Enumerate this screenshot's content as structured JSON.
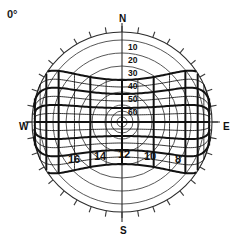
{
  "figure": {
    "kind": "horizon-coordinate-diagram",
    "latitude_label": "0°",
    "center": {
      "x": 122,
      "y": 122
    },
    "outer_radius": 90,
    "line_color": "#1a1a1a",
    "grid_color": "#3a3a3a",
    "background": "#ffffff"
  },
  "cardinals": {
    "north": "N",
    "south": "S",
    "west": "W",
    "east": "E"
  },
  "chart_data": {
    "type": "scatter",
    "title": "",
    "subtitle": "",
    "xlabel": "",
    "ylabel": "",
    "projection": "polar-altitude-azimuth",
    "grid": true,
    "legend_position": "none",
    "altitude_circles": {
      "label_axis": "north-meridian",
      "labels": [
        "10",
        "20",
        "30",
        "40",
        "50",
        "60"
      ],
      "values": [
        10,
        20,
        30,
        40,
        50,
        60
      ],
      "unlabeled_values": [
        70,
        80
      ],
      "label_positions_y": [
        47,
        60,
        73,
        86,
        99,
        112
      ],
      "radii": [
        82,
        69,
        56,
        43,
        30,
        17,
        11,
        5
      ]
    },
    "horizon_circle": {
      "altitude": 0,
      "radius": 90
    },
    "azimuth_ticks": {
      "count": 36,
      "interval_degrees": 10,
      "length": 6
    },
    "hour_angle_lines": {
      "labels": [
        "16",
        "14",
        "12",
        "10",
        "8"
      ],
      "values": [
        16,
        14,
        12,
        10,
        8
      ],
      "label_positions": [
        {
          "label": "16",
          "x": 74,
          "y": 163
        },
        {
          "label": "14",
          "x": 100,
          "y": 160
        },
        {
          "label": "12",
          "x": 124,
          "y": 158
        },
        {
          "label": "10",
          "x": 150,
          "y": 160
        },
        {
          "label": "8",
          "x": 178,
          "y": 163
        }
      ],
      "minor_count_between": 1
    },
    "declination_band": {
      "description": "Equatorial declination parallels overlaying horizon grid at latitude 0 degrees",
      "major_declinations": [
        -30,
        -20,
        -10,
        0,
        10,
        20,
        30
      ],
      "half_height_at_center": 42,
      "half_height_at_edge": 62
    },
    "axis_ranges": {
      "azimuth": [
        0,
        360
      ],
      "altitude": [
        0,
        90
      ]
    }
  }
}
